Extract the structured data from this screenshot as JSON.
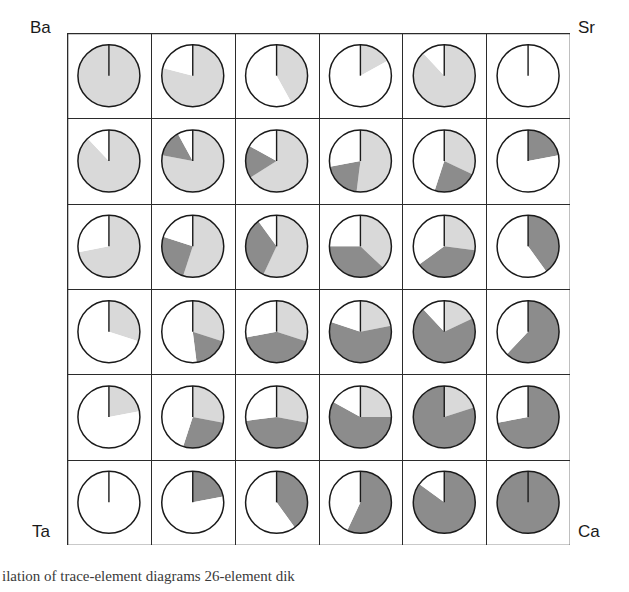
{
  "figure": {
    "type": "pie-matrix",
    "rows": 6,
    "cols": 6,
    "corner_labels": {
      "top_left": "Ba",
      "top_right": "Sr",
      "bottom_left": "Ta",
      "bottom_right": "Ca"
    },
    "caption": "ilation of trace-element diagrams     26-element dik"
  },
  "colors": {
    "light_gray": "#d9d9d9",
    "dark_gray": "#8c8c8c",
    "white": "#ffffff",
    "stroke": "#1a1a1a",
    "grid_line": "#2b2b2b",
    "text": "#1a1a1a"
  },
  "chart_data": {
    "type": "pie",
    "title": "",
    "xlabel": "",
    "ylabel": "",
    "series_names": [
      "light",
      "dark",
      "white"
    ],
    "legend_position": "none",
    "grid": true,
    "note": "6x6 matrix of 3-component pies; values are percentages of circle, drawn clockwise from 12 o'clock in order light, dark, white",
    "pies": [
      [
        {
          "light": 100,
          "dark": 0,
          "white": 0
        },
        {
          "light": 79,
          "dark": 0,
          "white": 21
        },
        {
          "light": 42,
          "dark": 0,
          "white": 58
        },
        {
          "light": 17,
          "dark": 0,
          "white": 83
        },
        {
          "light": 88,
          "dark": 0,
          "white": 12
        },
        {
          "light": 0,
          "dark": 0,
          "white": 100
        }
      ],
      [
        {
          "light": 88,
          "dark": 0,
          "white": 12
        },
        {
          "light": 78,
          "dark": 14,
          "white": 8
        },
        {
          "light": 66,
          "dark": 17,
          "white": 17
        },
        {
          "light": 52,
          "dark": 20,
          "white": 28
        },
        {
          "light": 32,
          "dark": 23,
          "white": 45
        },
        {
          "light": 0,
          "dark": 22,
          "white": 78
        }
      ],
      [
        {
          "light": 72,
          "dark": 0,
          "white": 28
        },
        {
          "light": 55,
          "dark": 25,
          "white": 20
        },
        {
          "light": 57,
          "dark": 33,
          "white": 10
        },
        {
          "light": 37,
          "dark": 38,
          "white": 25
        },
        {
          "light": 27,
          "dark": 38,
          "white": 35
        },
        {
          "light": 0,
          "dark": 40,
          "white": 60
        }
      ],
      [
        {
          "light": 30,
          "dark": 0,
          "white": 70
        },
        {
          "light": 30,
          "dark": 18,
          "white": 52
        },
        {
          "light": 30,
          "dark": 42,
          "white": 28
        },
        {
          "light": 22,
          "dark": 58,
          "white": 20
        },
        {
          "light": 18,
          "dark": 70,
          "white": 12
        },
        {
          "light": 0,
          "dark": 62,
          "white": 38
        }
      ],
      [
        {
          "light": 22,
          "dark": 0,
          "white": 78
        },
        {
          "light": 28,
          "dark": 27,
          "white": 45
        },
        {
          "light": 28,
          "dark": 45,
          "white": 27
        },
        {
          "light": 25,
          "dark": 58,
          "white": 17
        },
        {
          "light": 20,
          "dark": 80,
          "white": 0
        },
        {
          "light": 0,
          "dark": 72,
          "white": 28
        }
      ],
      [
        {
          "light": 0,
          "dark": 0,
          "white": 100
        },
        {
          "light": 0,
          "dark": 22,
          "white": 78
        },
        {
          "light": 0,
          "dark": 40,
          "white": 60
        },
        {
          "light": 0,
          "dark": 57,
          "white": 43
        },
        {
          "light": 0,
          "dark": 85,
          "white": 15
        },
        {
          "light": 0,
          "dark": 100,
          "white": 0
        }
      ]
    ]
  }
}
